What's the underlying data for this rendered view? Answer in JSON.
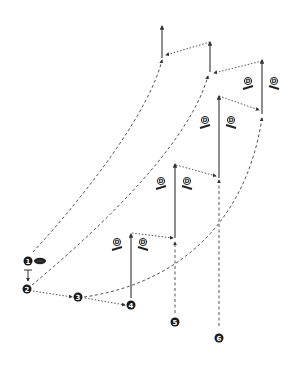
{
  "diagram": {
    "type": "football-drill-route-diagram",
    "colors": {
      "ink": "#222222",
      "line": "#444444",
      "background": "#ffffff"
    },
    "ball": {
      "icon": "football-icon"
    },
    "players": [
      {
        "label": "1"
      },
      {
        "label": "2"
      },
      {
        "label": "3"
      },
      {
        "label": "4"
      },
      {
        "label": "5"
      },
      {
        "label": "6"
      }
    ],
    "defenders": [
      {
        "label": "D"
      },
      {
        "label": "D"
      },
      {
        "label": "D"
      },
      {
        "label": "D"
      },
      {
        "label": "D"
      },
      {
        "label": "D"
      },
      {
        "label": "D"
      },
      {
        "label": "D"
      }
    ]
  }
}
